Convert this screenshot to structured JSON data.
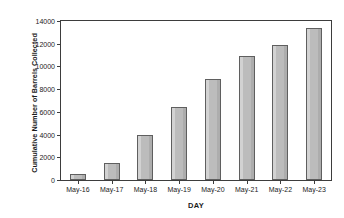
{
  "chart_data": {
    "type": "bar",
    "title": "",
    "subtitle": "",
    "xlabel": "DAY",
    "ylabel": "Cumulative Number of Barrels Collected",
    "categories": [
      "May-16",
      "May-17",
      "May-18",
      "May-19",
      "May-20",
      "May-21",
      "May-22",
      "May-23"
    ],
    "values": [
      500,
      1500,
      3950,
      6450,
      8900,
      10900,
      11900,
      13400
    ],
    "series": [
      {
        "name": "Cumulative Number of Barrels Collected",
        "values": [
          500,
          1500,
          3950,
          6450,
          8900,
          10900,
          11900,
          13400
        ]
      }
    ],
    "ylim": [
      0,
      14000
    ],
    "yticks": [
      0,
      2000,
      4000,
      6000,
      8000,
      10000,
      12000,
      14000
    ],
    "ytick_labels": [
      "0",
      "2000",
      "4000",
      "6000",
      "8000",
      "10000",
      "12000",
      "14000"
    ],
    "grid": false,
    "legend": false,
    "legend_position": "none",
    "bar_color": "#bdbdbd",
    "bar_edge_color": "#5f5f5f",
    "axis_color": "#3d3d3d",
    "background_color": "#ffffff",
    "text_color": "#1b1b1b"
  }
}
